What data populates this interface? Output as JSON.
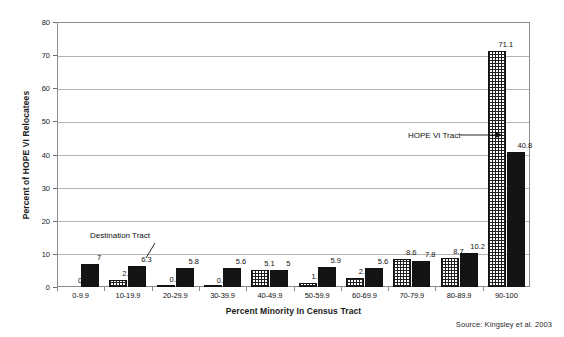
{
  "chart_data": {
    "type": "bar",
    "title": "",
    "subtitle": "",
    "xlabel": "Percent Minority In Census Tract",
    "ylabel": "Percent of HOPE VI Relocatees",
    "categories": [
      "0-9.9",
      "10-19.9",
      "20-29.9",
      "30-39.9",
      "40-49.9",
      "50-59.9",
      "60-69.9",
      "70-79.9",
      "80-89.9",
      "90-100"
    ],
    "series": [
      {
        "name": "HOPE VI Tract",
        "pattern": "cross-hatch",
        "values": [
          0,
          2.1,
          0.4,
          0.1,
          5.1,
          1.2,
          2.7,
          8.6,
          8.7,
          71.1
        ],
        "labels": [
          "0",
          "2.1",
          "0.4",
          "0.1",
          "5.1",
          "1.2",
          "2.7",
          "8.6",
          "8.7",
          "71.1"
        ]
      },
      {
        "name": "Destination Tract",
        "pattern": "solid-black",
        "values": [
          7,
          6.3,
          5.8,
          5.6,
          5,
          5.9,
          5.6,
          7.8,
          10.2,
          40.8
        ],
        "labels": [
          "7",
          "6.3",
          "5.8",
          "5.6",
          "5",
          "5.9",
          "5.6",
          "7.8",
          "10.2",
          "40.8"
        ]
      }
    ],
    "ylim": [
      0,
      80
    ],
    "yticks": [
      0,
      10,
      20,
      30,
      40,
      50,
      60,
      70,
      80
    ],
    "ytick_labels": [
      "0",
      "10",
      "20",
      "30",
      "40",
      "50",
      "60",
      "70",
      "80"
    ],
    "grid": "horizontal",
    "legend": "none",
    "annotations": [
      {
        "text": "Destination Tract",
        "points_to": "10-19.9 destination bar"
      },
      {
        "text": "HOPE VI Tract",
        "points_to": "90-100 hope vi bar"
      }
    ],
    "source": "Source: Kingsley et al. 2003"
  },
  "colors": {
    "bar_solid": "#141414",
    "bar_hatch_line": "#1f1f1f",
    "grid": "#b4b4b4",
    "frame": "#8c8c8c",
    "text": "#111111",
    "background": "#ffffff"
  }
}
